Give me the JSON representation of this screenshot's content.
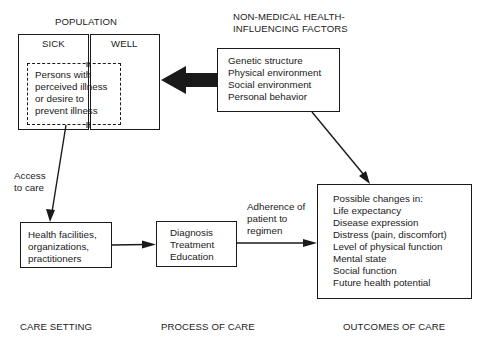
{
  "diagram": {
    "population": {
      "title": "POPULATION",
      "sick_label": "SICK",
      "well_label": "WELL",
      "inner_box_lines": [
        "Persons with",
        "perceived illness",
        "or desire to",
        "prevent illness"
      ]
    },
    "non_medical": {
      "title_lines": [
        "NON-MEDICAL HEALTH-",
        "INFLUENCING FACTORS"
      ],
      "items": [
        "Genetic structure",
        "Physical environment",
        "Social environment",
        "Personal behavior"
      ]
    },
    "access_label_lines": [
      "Access",
      "to care"
    ],
    "care_setting": {
      "box_lines": [
        "Health facilities,",
        "organizations,",
        "practitioners"
      ],
      "footer": "CARE SETTING"
    },
    "process_of_care": {
      "box_lines": [
        "Diagnosis",
        "Treatment",
        "Education"
      ],
      "footer": "PROCESS OF CARE"
    },
    "adherence_label_lines": [
      "Adherence of",
      "patient to",
      "regimen"
    ],
    "outcomes": {
      "box_lines": [
        "Possible changes in:",
        "Life expectancy",
        "Disease expression",
        "Distress (pain, discomfort)",
        "Level of physical function",
        "Mental state",
        "Social function",
        "Future health potential"
      ],
      "footer": "OUTCOMES OF CARE"
    },
    "colors": {
      "ink": "#1a1a1a",
      "background": "#ffffff"
    }
  }
}
